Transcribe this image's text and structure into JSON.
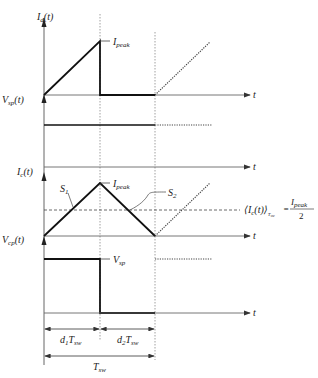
{
  "diagram": {
    "type": "timing-waveforms",
    "panels": [
      {
        "name": "inductor-current",
        "axis_label": "I",
        "axis_sub": "d",
        "axis_suffix": "(t)",
        "peak_label": "I",
        "peak_sub": "peak",
        "time_label": "t"
      },
      {
        "name": "switch-voltage-sp",
        "axis_label": "V",
        "axis_sub": "sp",
        "axis_suffix": "(t)",
        "time_label": "t"
      },
      {
        "name": "capacitor-current",
        "axis_label": "I",
        "axis_sub": "c",
        "axis_suffix": "(t)",
        "peak_label": "I",
        "peak_sub": "peak",
        "slope1_label": "S",
        "slope1_sub": "1",
        "slope2_label": "S",
        "slope2_sub": "2",
        "time_label": "t"
      },
      {
        "name": "switch-voltage-cp",
        "axis_label": "V",
        "axis_sub": "cp",
        "axis_suffix": "(t)",
        "level_label": "V",
        "level_sub": "sp",
        "time_label": "t"
      }
    ],
    "average_equation": {
      "lhs": "⟨I",
      "lhs_sub": "c",
      "lhs_mid": "(t)⟩",
      "lhs_period": "T",
      "lhs_period_sub": "sw",
      "equals": "=",
      "numerator": "I",
      "numerator_sub": "peak",
      "denominator": "2"
    },
    "dimensions": {
      "d1": {
        "coef": "d",
        "coef_sub": "1",
        "T": "T",
        "T_sub": "sw"
      },
      "d2": {
        "coef": "d",
        "coef_sub": "2",
        "T": "T",
        "T_sub": "sw"
      },
      "period": {
        "T": "T",
        "T_sub": "sw"
      }
    }
  }
}
